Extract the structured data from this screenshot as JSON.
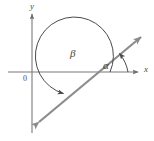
{
  "figure": {
    "type": "geometry-diagram",
    "width": 154,
    "height": 141,
    "background_color": "#ffffff"
  },
  "axes": {
    "x_axis": {
      "label": "x",
      "color": "#7a7a7a",
      "arrow": "right",
      "y_position": 72,
      "x_start": 8,
      "x_end": 140
    },
    "y_axis": {
      "label": "y",
      "color": "#7a7a7a",
      "arrow": "up",
      "x_position": 32,
      "y_start": 12,
      "y_end": 133
    },
    "origin": {
      "label": "0",
      "x": 32,
      "y": 72
    }
  },
  "line": {
    "name": "terminal-line",
    "color": "#8c8c8c",
    "stroke_width": 2.2,
    "arrows": "both",
    "start": {
      "x": 36,
      "y": 125
    },
    "end": {
      "x": 144,
      "y": 34
    },
    "slope_degrees": 40
  },
  "angles": [
    {
      "name": "alpha",
      "symbol": "α",
      "color": "#3d3d3d",
      "direction": "counterclockwise",
      "from": "positive x-axis",
      "to": "terminal ray",
      "approx_degrees": 40,
      "arc_radius": 32,
      "label_x": 103,
      "label_y": 60
    },
    {
      "name": "beta",
      "symbol": "β",
      "color": "#3d3d3d",
      "direction": "clockwise-sweep-to-lower-left-ray",
      "from": "positive x-axis direction",
      "to": "opposite ray of the line",
      "approx_degrees": 220,
      "arc_radius": 38,
      "label_x": 70,
      "label_y": 48
    }
  ],
  "colors": {
    "axis": "#7a7a7a",
    "line": "#8c8c8c",
    "arc": "#4a4a4a",
    "text": "#3d3d3d",
    "background": "#ffffff"
  }
}
